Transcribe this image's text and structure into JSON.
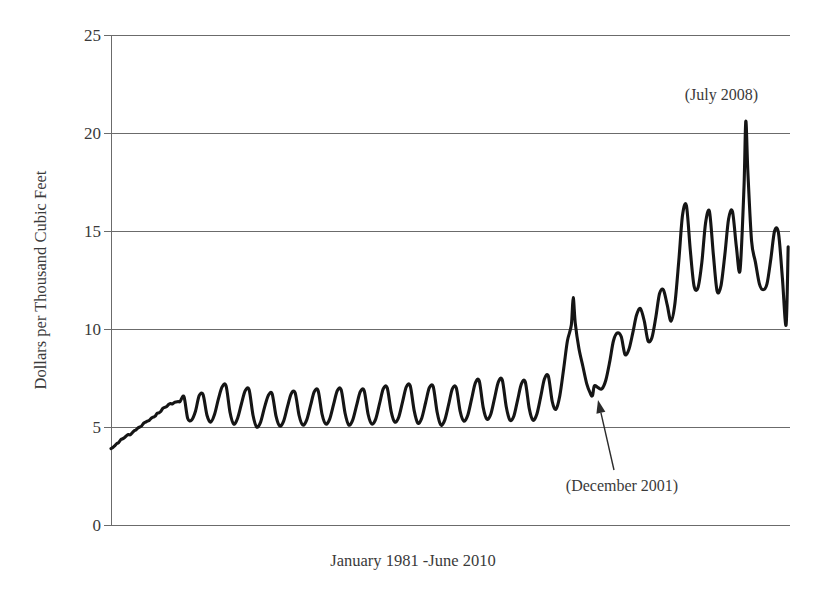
{
  "chart_data": {
    "type": "line",
    "title": "",
    "subtitle": "",
    "xlabel": "January 1981 -June 2010",
    "ylabel": "Dollars per Thousand Cubic Feet",
    "grid": "horizontal",
    "legend": "none",
    "xlim": [
      1981.0,
      2010.5
    ],
    "ylim": [
      0,
      25
    ],
    "yticks": [
      0,
      5,
      10,
      15,
      20,
      25
    ],
    "ytick_labels": [
      "0",
      "5",
      "10",
      "15",
      "20",
      "25"
    ],
    "xticks": [],
    "xtick_labels": [],
    "series": [
      {
        "name": "U.S. Natural Gas Residential Price",
        "color": "#151515",
        "x": [
          1981.0,
          1981.08,
          1981.17,
          1981.25,
          1981.33,
          1981.42,
          1981.5,
          1981.58,
          1981.67,
          1981.75,
          1981.83,
          1981.92,
          1982.0,
          1982.08,
          1982.17,
          1982.25,
          1982.33,
          1982.42,
          1982.5,
          1982.58,
          1982.67,
          1982.75,
          1982.83,
          1982.92,
          1983.0,
          1983.08,
          1983.17,
          1983.25,
          1983.33,
          1983.42,
          1983.5,
          1983.58,
          1983.67,
          1983.75,
          1983.83,
          1983.92,
          1984.0,
          1984.17,
          1984.33,
          1984.5,
          1984.67,
          1984.83,
          1985.0,
          1985.17,
          1985.33,
          1985.5,
          1985.67,
          1985.83,
          1986.0,
          1986.17,
          1986.33,
          1986.5,
          1986.67,
          1986.83,
          1987.0,
          1987.17,
          1987.33,
          1987.5,
          1987.67,
          1987.83,
          1988.0,
          1988.17,
          1988.33,
          1988.5,
          1988.67,
          1988.83,
          1989.0,
          1989.17,
          1989.33,
          1989.5,
          1989.67,
          1989.83,
          1990.0,
          1990.17,
          1990.33,
          1990.5,
          1990.67,
          1990.83,
          1991.0,
          1991.17,
          1991.33,
          1991.5,
          1991.67,
          1991.83,
          1992.0,
          1992.17,
          1992.33,
          1992.5,
          1992.67,
          1992.83,
          1993.0,
          1993.17,
          1993.33,
          1993.5,
          1993.67,
          1993.83,
          1994.0,
          1994.17,
          1994.33,
          1994.5,
          1994.67,
          1994.83,
          1995.0,
          1995.17,
          1995.33,
          1995.5,
          1995.67,
          1995.83,
          1996.0,
          1996.17,
          1996.33,
          1996.5,
          1996.67,
          1996.83,
          1997.0,
          1997.17,
          1997.33,
          1997.5,
          1997.67,
          1997.83,
          1998.0,
          1998.17,
          1998.33,
          1998.5,
          1998.67,
          1998.83,
          1999.0,
          1999.17,
          1999.33,
          1999.5,
          1999.67,
          1999.83,
          2000.0,
          2000.17,
          2000.33,
          2000.5,
          2000.67,
          2000.83,
          2001.0,
          2001.08,
          2001.17,
          2001.33,
          2001.5,
          2001.67,
          2001.83,
          2001.92,
          2002.0,
          2002.17,
          2002.33,
          2002.5,
          2002.67,
          2002.83,
          2003.0,
          2003.17,
          2003.33,
          2003.5,
          2003.67,
          2003.83,
          2004.0,
          2004.17,
          2004.33,
          2004.5,
          2004.67,
          2004.83,
          2005.0,
          2005.17,
          2005.33,
          2005.5,
          2005.67,
          2005.83,
          2006.0,
          2006.17,
          2006.33,
          2006.5,
          2006.67,
          2006.83,
          2007.0,
          2007.17,
          2007.33,
          2007.5,
          2007.67,
          2007.83,
          2008.0,
          2008.17,
          2008.33,
          2008.5,
          2008.58,
          2008.67,
          2008.83,
          2009.0,
          2009.17,
          2009.33,
          2009.5,
          2009.67,
          2009.83,
          2010.0,
          2010.17,
          2010.33,
          2010.42
        ],
        "y": [
          3.9,
          3.95,
          4.05,
          4.15,
          4.2,
          4.35,
          4.4,
          4.45,
          4.55,
          4.62,
          4.6,
          4.7,
          4.8,
          4.85,
          4.95,
          5.0,
          5.05,
          5.2,
          5.25,
          5.3,
          5.35,
          5.45,
          5.5,
          5.55,
          5.7,
          5.72,
          5.8,
          5.95,
          6.0,
          6.05,
          6.15,
          6.2,
          6.18,
          6.25,
          6.28,
          6.3,
          6.3,
          6.55,
          5.45,
          5.35,
          5.8,
          6.6,
          6.65,
          5.6,
          5.25,
          5.65,
          6.45,
          7.05,
          7.1,
          5.75,
          5.15,
          5.45,
          6.2,
          6.85,
          6.9,
          5.6,
          5.0,
          5.25,
          6.0,
          6.6,
          6.7,
          5.55,
          5.05,
          5.3,
          6.05,
          6.7,
          6.75,
          5.6,
          5.1,
          5.35,
          6.1,
          6.8,
          6.85,
          5.65,
          5.15,
          5.4,
          6.15,
          6.85,
          6.9,
          5.7,
          5.1,
          5.35,
          6.1,
          6.8,
          6.85,
          5.65,
          5.15,
          5.4,
          6.2,
          6.95,
          7.0,
          5.8,
          5.25,
          5.5,
          6.3,
          7.05,
          7.1,
          5.85,
          5.2,
          5.45,
          6.25,
          7.0,
          7.05,
          5.75,
          5.1,
          5.35,
          6.15,
          6.95,
          7.0,
          5.8,
          5.3,
          5.6,
          6.45,
          7.25,
          7.35,
          6.0,
          5.4,
          5.65,
          6.5,
          7.3,
          7.4,
          6.05,
          5.35,
          5.55,
          6.4,
          7.2,
          7.3,
          5.95,
          5.35,
          5.65,
          6.55,
          7.45,
          7.6,
          6.3,
          5.9,
          6.6,
          8.0,
          9.4,
          10.2,
          11.6,
          10.3,
          9.0,
          8.1,
          7.2,
          6.7,
          6.6,
          7.1,
          7.0,
          6.95,
          7.4,
          8.35,
          9.4,
          9.8,
          9.6,
          8.7,
          8.95,
          9.8,
          10.7,
          11.05,
          10.4,
          9.4,
          9.55,
          10.6,
          11.8,
          12.0,
          11.2,
          10.4,
          11.3,
          13.5,
          15.8,
          16.3,
          14.0,
          12.2,
          12.1,
          13.4,
          15.4,
          16.0,
          13.8,
          11.95,
          12.2,
          13.8,
          15.6,
          16.0,
          14.2,
          13.0,
          17.2,
          20.6,
          18.0,
          14.5,
          13.4,
          12.3,
          12.0,
          12.3,
          13.6,
          15.0,
          14.9,
          12.6,
          10.2,
          14.2
        ]
      }
    ],
    "annotations": [
      {
        "name": "july-2008-peak",
        "label": "(July 2008)",
        "x_px": 758,
        "y_px": 100,
        "anchor": "end"
      },
      {
        "name": "december-2001-trough",
        "label": "(December 2001)",
        "x_px": 622,
        "y_px": 491,
        "anchor": "middle",
        "arrow_from_px": [
          614,
          470
        ],
        "arrow_to_px": [
          598,
          400
        ]
      }
    ]
  },
  "axis": {
    "y_tick_labels": [
      "25",
      "20",
      "15",
      "10",
      "5",
      "0"
    ],
    "y_title": "Dollars per Thousand Cubic Feet",
    "x_title": "January 1981 -June 2010"
  },
  "colors": {
    "line": "#151515",
    "grid": "#6b6b6b",
    "text": "#3a3a3a",
    "background": "#ffffff"
  }
}
